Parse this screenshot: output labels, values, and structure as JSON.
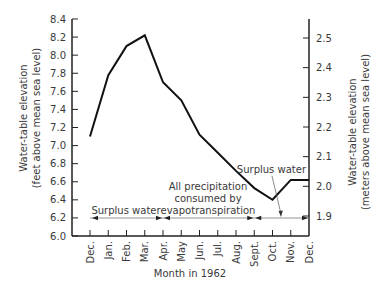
{
  "chart_data": {
    "type": "line",
    "title": "",
    "xlabel": "Month in 1962",
    "ylabel": "Water-table elevation (feet above mean sea level)",
    "ylabel_lines": [
      "Water-table elevation",
      "(feet above mean sea level)"
    ],
    "y2label": "Water-table elevation (meters above mean sea level)",
    "y2label_lines": [
      "Water-table elevation",
      "(meters above mean sea level)"
    ],
    "categories": [
      "Dec.",
      "Jan.",
      "Feb.",
      "Mar.",
      "Apr.",
      "May",
      "Jun.",
      "Jul.",
      "Aug.",
      "Sept.",
      "Oct.",
      "Nov.",
      "Dec."
    ],
    "series": [
      {
        "name": "Water-table elevation",
        "values": [
          7.1,
          7.78,
          8.1,
          8.22,
          7.7,
          7.5,
          7.12,
          6.92,
          6.72,
          6.53,
          6.4,
          6.62,
          6.62
        ]
      }
    ],
    "ylim": [
      6.0,
      8.4
    ],
    "yticks": [
      "6.0",
      "6.2",
      "6.4",
      "6.6",
      "6.8",
      "7.0",
      "7.2",
      "7.4",
      "7.6",
      "7.8",
      "8.0",
      "8.2",
      "8.4"
    ],
    "y2lim": [
      1.83,
      2.56
    ],
    "y2ticks": [
      "1.9",
      "2.0",
      "2.1",
      "2.2",
      "2.3",
      "2.4",
      "2.5"
    ],
    "grid": false,
    "legend": null,
    "annotations": [
      {
        "text": "Surplus water",
        "range": [
          "Dec.",
          "Apr."
        ]
      },
      {
        "text": "All precipitation consumed by evapotranspiration",
        "lines": [
          "All precipitation",
          "consumed by",
          "evapotranspiration"
        ],
        "range": [
          "Apr.",
          "Sept."
        ]
      },
      {
        "text": "Surplus water",
        "range": [
          "Sept.",
          "Dec."
        ]
      }
    ]
  }
}
